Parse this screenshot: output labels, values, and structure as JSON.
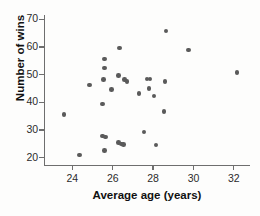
{
  "chart_data": {
    "type": "scatter",
    "title": "",
    "xlabel": "Average age (years)",
    "ylabel": "Number of wins",
    "xlim": [
      22.6,
      32.8
    ],
    "ylim": [
      17.5,
      71.5
    ],
    "grid": false,
    "legend": null,
    "xticks": [
      24,
      26,
      28,
      30,
      32
    ],
    "yticks": [
      20,
      30,
      40,
      50,
      60,
      70
    ],
    "point_color": "#5a5a5a",
    "axis_color": "#6e6e6e",
    "n_points": 33,
    "points": [
      {
        "x": 23.6,
        "y": 35.5
      },
      {
        "x": 24.35,
        "y": 21.0
      },
      {
        "x": 24.85,
        "y": 46.3
      },
      {
        "x": 25.5,
        "y": 39.4
      },
      {
        "x": 25.55,
        "y": 48.3
      },
      {
        "x": 25.6,
        "y": 52.3
      },
      {
        "x": 25.6,
        "y": 55.6
      },
      {
        "x": 25.5,
        "y": 27.8
      },
      {
        "x": 25.65,
        "y": 27.4
      },
      {
        "x": 25.6,
        "y": 22.6
      },
      {
        "x": 25.95,
        "y": 44.6
      },
      {
        "x": 26.3,
        "y": 49.6
      },
      {
        "x": 26.35,
        "y": 59.6
      },
      {
        "x": 26.3,
        "y": 25.5
      },
      {
        "x": 26.45,
        "y": 25.0
      },
      {
        "x": 26.55,
        "y": 24.8
      },
      {
        "x": 26.6,
        "y": 48.3
      },
      {
        "x": 26.7,
        "y": 47.6
      },
      {
        "x": 27.3,
        "y": 43.2
      },
      {
        "x": 27.55,
        "y": 29.3
      },
      {
        "x": 27.7,
        "y": 48.4
      },
      {
        "x": 27.85,
        "y": 48.4
      },
      {
        "x": 27.8,
        "y": 44.9
      },
      {
        "x": 28.05,
        "y": 42.3
      },
      {
        "x": 28.15,
        "y": 24.6
      },
      {
        "x": 28.55,
        "y": 36.6
      },
      {
        "x": 28.6,
        "y": 47.5
      },
      {
        "x": 28.65,
        "y": 65.7
      },
      {
        "x": 29.75,
        "y": 58.8
      },
      {
        "x": 32.15,
        "y": 50.7
      }
    ]
  }
}
